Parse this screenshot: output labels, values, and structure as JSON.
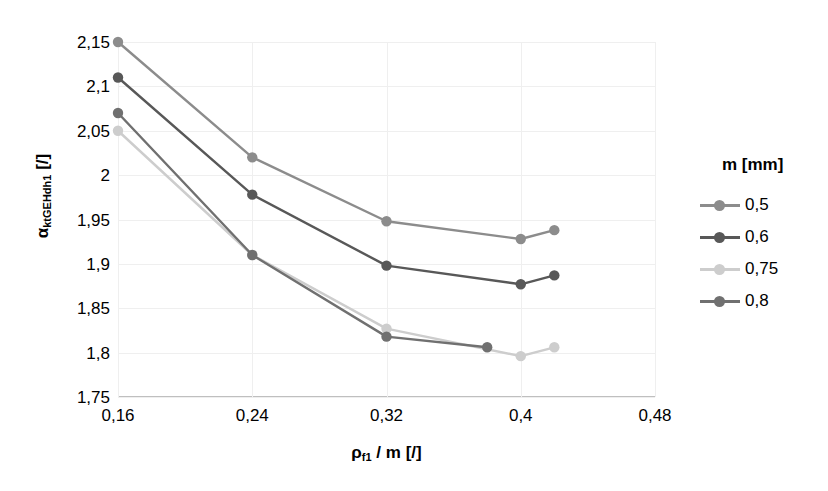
{
  "chart_data": {
    "type": "line",
    "title": "",
    "xlabel": "ρf1 / m [/]",
    "ylabel": "αktGEHdh1 [/]",
    "xlim": [
      0.16,
      0.48
    ],
    "ylim": [
      1.75,
      2.15
    ],
    "grid": true,
    "legend_position": "right",
    "legend_title": "m [mm]",
    "xticks": [
      "0,16",
      "0,24",
      "0,32",
      "0,4",
      "0,48"
    ],
    "xtick_values": [
      0.16,
      0.24,
      0.32,
      0.4,
      0.48
    ],
    "yticks": [
      "2,15",
      "2,1",
      "2,05",
      "2",
      "1,95",
      "1,9",
      "1,85",
      "1,8",
      "1,75"
    ],
    "ytick_values": [
      2.15,
      2.1,
      2.05,
      2.0,
      1.95,
      1.9,
      1.85,
      1.8,
      1.75
    ],
    "series": [
      {
        "name": "0,5",
        "color": "#8c8c8c",
        "x": [
          0.16,
          0.24,
          0.32,
          0.4,
          0.42
        ],
        "values": [
          2.15,
          2.02,
          1.948,
          1.928,
          1.938
        ]
      },
      {
        "name": "0,6",
        "color": "#585858",
        "x": [
          0.16,
          0.24,
          0.32,
          0.4,
          0.42
        ],
        "values": [
          2.11,
          1.978,
          1.898,
          1.877,
          1.887
        ]
      },
      {
        "name": "0,75",
        "color": "#cdcdcd",
        "x": [
          0.16,
          0.24,
          0.32,
          0.4,
          0.42
        ],
        "values": [
          2.05,
          1.91,
          1.827,
          1.796,
          1.806
        ]
      },
      {
        "name": "0,8",
        "color": "#707070",
        "x": [
          0.16,
          0.24,
          0.32,
          0.38
        ],
        "values": [
          2.07,
          1.91,
          1.818,
          1.806
        ]
      }
    ]
  },
  "axes": {
    "y_title_main": "α",
    "y_title_sub": "ktGEHdh1",
    "y_title_unit": " [/]",
    "x_title_main": "ρ",
    "x_title_sub": "f1",
    "x_title_rest": " / m [/]"
  }
}
